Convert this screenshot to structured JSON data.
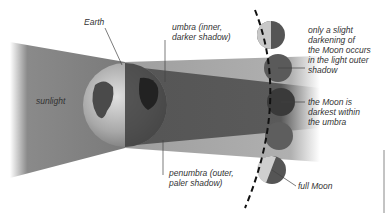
{
  "diagram": {
    "labels": {
      "earth": "Earth",
      "sunlight": "sunlight",
      "umbra_line1": "umbra (inner,",
      "umbra_line2": "darker shadow)",
      "penumbra_line1": "penumbra (outer,",
      "penumbra_line2": "paler shadow)",
      "slight_line1": "only a slight",
      "slight_line2": "darkening of",
      "slight_line3": "the Moon occurs",
      "slight_line4": "in the light outer",
      "slight_line5": "shadow",
      "darkest_line1": "the Moon is",
      "darkest_line2": "darkest within",
      "darkest_line3": "the umbra",
      "full_moon": "full Moon"
    },
    "colors": {
      "penumbra": "#9a9a9a",
      "umbra": "#5e5e5e",
      "text": "#333333",
      "moon_dark": "#4a4a4a"
    }
  }
}
